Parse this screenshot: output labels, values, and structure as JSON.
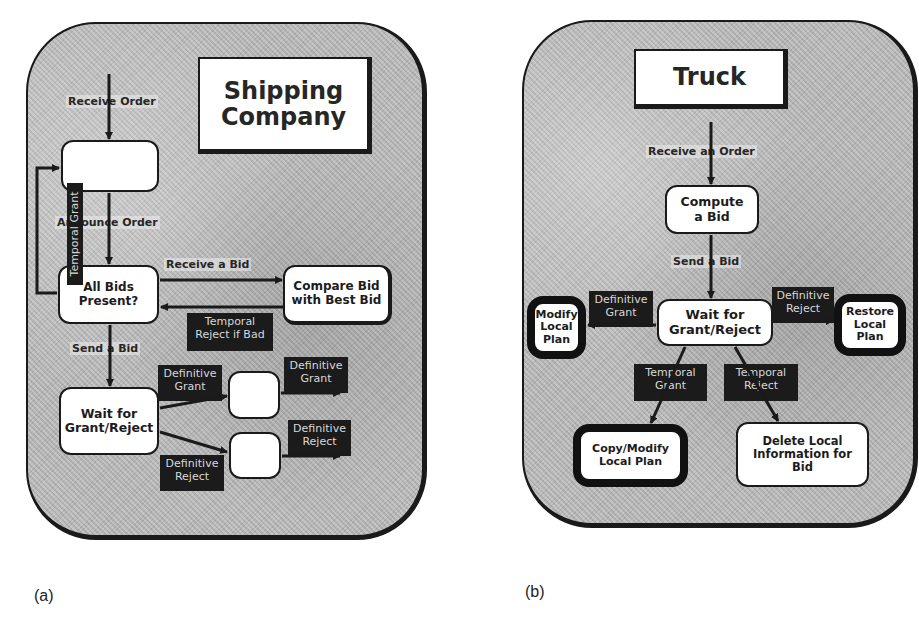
{
  "figure": {
    "panels": [
      {
        "id": "a",
        "caption": "(a)",
        "title": "Shipping Company",
        "nodes": {
          "order_box": "",
          "all_bids": "All Bids Present?",
          "compare_bid": "Compare Bid with Best Bid",
          "wait": "Wait for Grant/Reject",
          "grant_box": "",
          "reject_box": ""
        },
        "edge_labels": {
          "receive_order": "Receive Order",
          "announce_order": "Announce Order",
          "temporal_grant": "Temporal Grant",
          "receive_bid": "Receive a Bid",
          "temporal_reject_if_bad": "Temporal Reject if Bad",
          "send_bid": "Send a Bid",
          "definitive_grant_in": "Definitive Grant",
          "definitive_grant_out": "Definitive Grant",
          "definitive_reject_in": "Definitive Reject",
          "definitive_reject_out": "Definitive Reject"
        }
      },
      {
        "id": "b",
        "caption": "(b)",
        "title": "Truck",
        "nodes": {
          "compute_bid": "Compute a Bid",
          "wait": "Wait for Grant/Reject",
          "modify_local": "Modify Local Plan",
          "restore_local": "Restore Local Plan",
          "copy_modify": "Copy/Modify Local Plan",
          "delete_local": "Delete Local Information for Bid"
        },
        "edge_labels": {
          "receive_order": "Receive an Order",
          "send_bid": "Send a Bid",
          "definitive_grant": "Definitive Grant",
          "definitive_reject": "Definitive Reject",
          "temporal_grant": "Temporal Grant",
          "temporal_reject": "Temporal Reject"
        }
      }
    ],
    "colors": {
      "panel_fill": "#b9b9b9",
      "node_fill": "#ffffff",
      "stroke": "#1a1a1a",
      "tag_fill": "#1b1b1b",
      "tag_text": "#d8d8d8"
    }
  }
}
